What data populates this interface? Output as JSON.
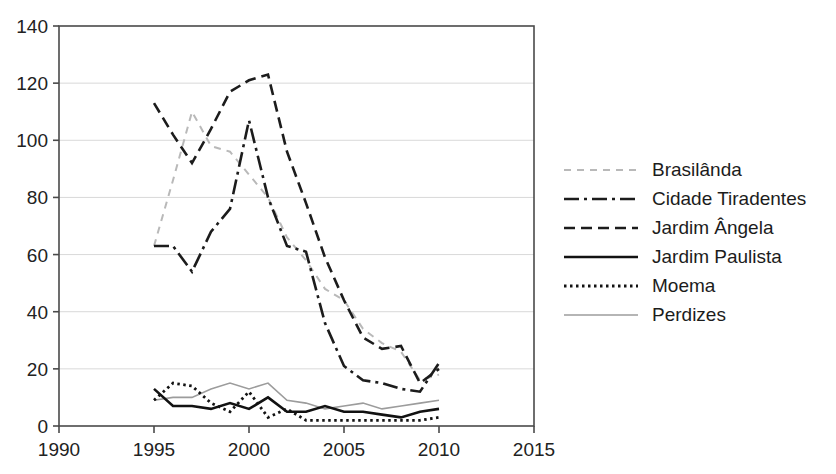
{
  "chart_data": {
    "type": "line",
    "title": "",
    "xlabel": "",
    "ylabel": "",
    "x": [
      1995,
      1996,
      1997,
      1998,
      1999,
      2000,
      2001,
      2002,
      2003,
      2004,
      2005,
      2006,
      2007,
      2008,
      2009,
      2010
    ],
    "series": [
      {
        "name": "Brasilânda",
        "color": "#b9b9b9",
        "dash": "dashed-small",
        "width": 2,
        "values": [
          63,
          86,
          110,
          98,
          96,
          88,
          80,
          66,
          58,
          48,
          44,
          34,
          29,
          26,
          16,
          18
        ]
      },
      {
        "name": "Cidade Tiradentes",
        "color": "#1c1c1c",
        "dash": "dash-dot",
        "width": 2.6,
        "values": [
          63,
          63,
          54,
          68,
          76,
          107,
          80,
          63,
          61,
          36,
          21,
          16,
          15,
          13,
          12,
          22
        ]
      },
      {
        "name": "Jardim Ângela",
        "color": "#1c1c1c",
        "dash": "dashed",
        "width": 2.6,
        "values": [
          113,
          102,
          92,
          104,
          117,
          121,
          123,
          96,
          78,
          59,
          44,
          31,
          27,
          28,
          15,
          20
        ]
      },
      {
        "name": "Jardim Paulista",
        "color": "#121212",
        "dash": "solid",
        "width": 2.6,
        "values": [
          13,
          7,
          7,
          6,
          8,
          6,
          10,
          5,
          5,
          7,
          5,
          5,
          4,
          3,
          5,
          6
        ]
      },
      {
        "name": "Moema",
        "color": "#121212",
        "dash": "dotted",
        "width": 2.8,
        "values": [
          9,
          15,
          14,
          8,
          5,
          12,
          3,
          6,
          2,
          2,
          2,
          2,
          2,
          2,
          2,
          3
        ]
      },
      {
        "name": "Perdizes",
        "color": "#9c9c9c",
        "dash": "solid",
        "width": 1.6,
        "values": [
          9,
          10,
          10,
          13,
          15,
          13,
          15,
          9,
          8,
          6,
          7,
          8,
          6,
          7,
          8,
          9
        ]
      }
    ],
    "x_ticks": [
      1990,
      1995,
      2000,
      2005,
      2010,
      2015
    ],
    "y_ticks": [
      0,
      20,
      40,
      60,
      80,
      100,
      120,
      140
    ],
    "xlim": [
      1990,
      2015
    ],
    "ylim": [
      0,
      140
    ],
    "grid": "horizontal",
    "gridline_color": "#d9d9d9",
    "axis_color": "#4a4a4a",
    "legend_position": "right"
  }
}
